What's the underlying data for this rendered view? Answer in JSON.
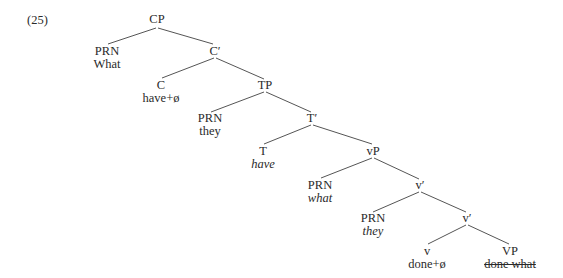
{
  "example_number": "(25)",
  "nodes": {
    "cp": {
      "label": "CP"
    },
    "prn_what": {
      "label": "PRN",
      "word": "What"
    },
    "c_bar": {
      "label": "C′"
    },
    "c": {
      "label": "C",
      "word": "have+ø"
    },
    "tp": {
      "label": "TP"
    },
    "prn_they": {
      "label": "PRN",
      "word": "they"
    },
    "t_bar": {
      "label": "T′"
    },
    "t": {
      "label": "T",
      "word": "have"
    },
    "vp_little": {
      "label": "vP"
    },
    "prn_what2": {
      "label": "PRN",
      "word": "what"
    },
    "v_bar_upper": {
      "label": "v′"
    },
    "prn_they2": {
      "label": "PRN",
      "word": "they"
    },
    "v_bar_lower": {
      "label": "v′"
    },
    "v": {
      "label": "v",
      "word": "done+ø"
    },
    "vp": {
      "label": "VP",
      "word": "done what"
    }
  },
  "edges": [
    [
      "CP",
      "PRN(What)"
    ],
    [
      "CP",
      "C′"
    ],
    [
      "C′",
      "C"
    ],
    [
      "C′",
      "TP"
    ],
    [
      "TP",
      "PRN(they)"
    ],
    [
      "TP",
      "T′"
    ],
    [
      "T′",
      "T"
    ],
    [
      "T′",
      "vP"
    ],
    [
      "vP",
      "PRN(what)"
    ],
    [
      "vP",
      "v′"
    ],
    [
      "v′",
      "PRN(they)"
    ],
    [
      "v′",
      "v′"
    ],
    [
      "v′",
      "v"
    ],
    [
      "v′",
      "VP"
    ]
  ],
  "styles": {
    "italic_words": [
      "have",
      "what",
      "they (lower)"
    ],
    "strikethrough_words": [
      "done what"
    ]
  }
}
